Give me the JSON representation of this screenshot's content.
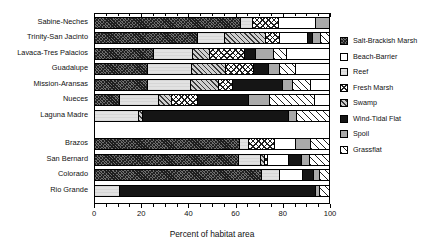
{
  "chart_data": {
    "type": "bar",
    "orientation": "horizontal",
    "stacked": true,
    "title": "",
    "xlabel": "Percent of habitat area",
    "ylabel": "",
    "xlim": [
      0,
      100
    ],
    "xticks": [
      0,
      20,
      40,
      60,
      80,
      100
    ],
    "xticklabels": [
      "0",
      "20",
      "40",
      "60",
      "80",
      "100"
    ],
    "grid": false,
    "legend_position": "right",
    "categories": [
      "Sabine-Neches",
      "Trinity-San Jacinto",
      "Lavaca-Tres Palacios",
      "Guadalupe",
      "Mission-Aransas",
      "Nueces",
      "Laguna Madre",
      "Brazos",
      "San Bernard",
      "Colorado",
      "Rio Grande"
    ],
    "group_break_after": "Laguna Madre",
    "series": [
      {
        "name": "Salt-Brackish Marsh",
        "pattern": "dense-dark-hatch",
        "values": [
          62.5,
          44.0,
          25.0,
          22.5,
          22.5,
          10.5,
          0.0,
          62.0,
          61.5,
          71.5,
          0.0
        ]
      },
      {
        "name": "Beach-Barrier",
        "pattern": "white-empty",
        "values": [
          0.0,
          0.0,
          0.0,
          0.0,
          0.0,
          0.0,
          0.0,
          0.0,
          0.0,
          0.0,
          0.0
        ]
      },
      {
        "name": "Reef",
        "pattern": "light-grey",
        "values": [
          5.0,
          11.5,
          17.0,
          19.0,
          18.5,
          17.0,
          19.0,
          4.0,
          9.5,
          7.5,
          10.5
        ]
      },
      {
        "name": "Fresh Marsh",
        "pattern": "cross-hatch",
        "values": [
          11.0,
          0.0,
          0.0,
          0.0,
          0.0,
          0.0,
          0.0,
          11.0,
          0.0,
          0.0,
          0.0
        ]
      },
      {
        "name": "Swamp",
        "pattern": "light-diagonal",
        "values": [
          0.0,
          17.5,
          7.0,
          14.5,
          12.0,
          5.5,
          1.5,
          0.0,
          1.5,
          0.0,
          0.0
        ]
      },
      {
        "name": "Wind-Tidal Flat",
        "pattern": "solid-black",
        "values": [
          0.0,
          2.0,
          5.0,
          6.5,
          21.5,
          22.0,
          62.5,
          0.0,
          5.5,
          4.5,
          84.0
        ]
      },
      {
        "name": "Spoil",
        "pattern": "mid-grey",
        "values": [
          5.5,
          3.5,
          7.5,
          4.5,
          4.0,
          9.0,
          3.5,
          6.5,
          3.5,
          2.5,
          1.5
        ]
      },
      {
        "name": "Grassflat",
        "pattern": "wide-diagonal",
        "values": [
          0.0,
          3.5,
          5.5,
          7.0,
          8.0,
          19.0,
          13.5,
          0.0,
          2.5,
          0.0,
          4.0
        ]
      }
    ],
    "rows": [
      {
        "category": "Sabine-Neches",
        "segments": [
          {
            "series": "Salt-Brackish Marsh",
            "value": 62.5
          },
          {
            "series": "Reef",
            "value": 5.0
          },
          {
            "series": "Fresh Marsh",
            "value": 11.0
          },
          {
            "series": "Beach-Barrier",
            "value": 16.0
          },
          {
            "series": "Spoil",
            "value": 5.5
          }
        ]
      },
      {
        "category": "Trinity-San Jacinto",
        "segments": [
          {
            "series": "Salt-Brackish Marsh",
            "value": 44.0
          },
          {
            "series": "Reef",
            "value": 11.5
          },
          {
            "series": "Swamp",
            "value": 17.5
          },
          {
            "series": "Fresh Marsh",
            "value": 6.0
          },
          {
            "series": "Beach-Barrier",
            "value": 12.0
          },
          {
            "series": "Wind-Tidal Flat",
            "value": 2.0
          },
          {
            "series": "Spoil",
            "value": 3.5
          },
          {
            "series": "Grassflat",
            "value": 3.5
          }
        ]
      },
      {
        "category": "Lavaca-Tres Palacios",
        "segments": [
          {
            "series": "Salt-Brackish Marsh",
            "value": 25.0
          },
          {
            "series": "Reef",
            "value": 17.0
          },
          {
            "series": "Swamp",
            "value": 7.0
          },
          {
            "series": "Fresh Marsh",
            "value": 15.0
          },
          {
            "series": "Wind-Tidal Flat",
            "value": 5.0
          },
          {
            "series": "Spoil",
            "value": 7.5
          },
          {
            "series": "Grassflat",
            "value": 5.5
          },
          {
            "series": "Beach-Barrier",
            "value": 18.0
          }
        ]
      },
      {
        "category": "Guadalupe",
        "segments": [
          {
            "series": "Salt-Brackish Marsh",
            "value": 22.5
          },
          {
            "series": "Reef",
            "value": 19.0
          },
          {
            "series": "Swamp",
            "value": 14.5
          },
          {
            "series": "Fresh Marsh",
            "value": 12.0
          },
          {
            "series": "Wind-Tidal Flat",
            "value": 6.5
          },
          {
            "series": "Spoil",
            "value": 4.5
          },
          {
            "series": "Grassflat",
            "value": 7.0
          },
          {
            "series": "Beach-Barrier",
            "value": 14.0
          }
        ]
      },
      {
        "category": "Mission-Aransas",
        "segments": [
          {
            "series": "Salt-Brackish Marsh",
            "value": 22.5
          },
          {
            "series": "Reef",
            "value": 18.5
          },
          {
            "series": "Swamp",
            "value": 12.0
          },
          {
            "series": "Fresh Marsh",
            "value": 6.0
          },
          {
            "series": "Wind-Tidal Flat",
            "value": 21.5
          },
          {
            "series": "Spoil",
            "value": 4.0
          },
          {
            "series": "Grassflat",
            "value": 8.0
          },
          {
            "series": "Beach-Barrier",
            "value": 7.5
          }
        ]
      },
      {
        "category": "Nueces",
        "segments": [
          {
            "series": "Salt-Brackish Marsh",
            "value": 10.5
          },
          {
            "series": "Reef",
            "value": 17.0
          },
          {
            "series": "Swamp",
            "value": 5.5
          },
          {
            "series": "Fresh Marsh",
            "value": 11.0
          },
          {
            "series": "Wind-Tidal Flat",
            "value": 22.0
          },
          {
            "series": "Spoil",
            "value": 9.0
          },
          {
            "series": "Grassflat",
            "value": 19.0
          },
          {
            "series": "Beach-Barrier",
            "value": 6.0
          }
        ]
      },
      {
        "category": "Laguna Madre",
        "segments": [
          {
            "series": "Reef",
            "value": 19.0
          },
          {
            "series": "Swamp",
            "value": 1.5
          },
          {
            "series": "Wind-Tidal Flat",
            "value": 62.5
          },
          {
            "series": "Spoil",
            "value": 3.5
          },
          {
            "series": "Grassflat",
            "value": 13.5
          }
        ]
      },
      {
        "category": "Brazos",
        "segments": [
          {
            "series": "Salt-Brackish Marsh",
            "value": 62.0
          },
          {
            "series": "Reef",
            "value": 4.0
          },
          {
            "series": "Fresh Marsh",
            "value": 11.0
          },
          {
            "series": "Beach-Barrier",
            "value": 9.0
          },
          {
            "series": "Spoil",
            "value": 6.5
          },
          {
            "series": "Grassflat",
            "value": 7.5
          }
        ]
      },
      {
        "category": "San Bernard",
        "segments": [
          {
            "series": "Salt-Brackish Marsh",
            "value": 61.5
          },
          {
            "series": "Reef",
            "value": 9.5
          },
          {
            "series": "Swamp",
            "value": 1.5
          },
          {
            "series": "Fresh Marsh",
            "value": 1.5
          },
          {
            "series": "Beach-Barrier",
            "value": 9.0
          },
          {
            "series": "Wind-Tidal Flat",
            "value": 5.5
          },
          {
            "series": "Spoil",
            "value": 3.5
          },
          {
            "series": "Grassflat",
            "value": 8.0
          }
        ]
      },
      {
        "category": "Colorado",
        "segments": [
          {
            "series": "Salt-Brackish Marsh",
            "value": 71.5
          },
          {
            "series": "Reef",
            "value": 7.5
          },
          {
            "series": "Beach-Barrier",
            "value": 10.0
          },
          {
            "series": "Wind-Tidal Flat",
            "value": 4.5
          },
          {
            "series": "Spoil",
            "value": 2.5
          },
          {
            "series": "Grassflat",
            "value": 4.0
          }
        ]
      },
      {
        "category": "Rio Grande",
        "segments": [
          {
            "series": "Reef",
            "value": 10.5
          },
          {
            "series": "Wind-Tidal Flat",
            "value": 84.0
          },
          {
            "series": "Spoil",
            "value": 1.5
          },
          {
            "series": "Grassflat",
            "value": 4.0
          }
        ]
      }
    ]
  },
  "legend": {
    "items": [
      {
        "label": "Salt-Brackish Marsh",
        "pattern_class": "p1"
      },
      {
        "label": "Beach-Barrier",
        "pattern_class": "p2"
      },
      {
        "label": "Reef",
        "pattern_class": "p3"
      },
      {
        "label": "Fresh Marsh",
        "pattern_class": "p4"
      },
      {
        "label": "Swamp",
        "pattern_class": "p5"
      },
      {
        "label": "Wind-Tidal Flat",
        "pattern_class": "p6"
      },
      {
        "label": "Spoil",
        "pattern_class": "p7"
      },
      {
        "label": "Grassflat",
        "pattern_class": "p8"
      }
    ]
  },
  "axis": {
    "x_title": "Percent of habitat area",
    "x_ticklabels": [
      "0",
      "20",
      "40",
      "60",
      "80",
      "100"
    ]
  }
}
